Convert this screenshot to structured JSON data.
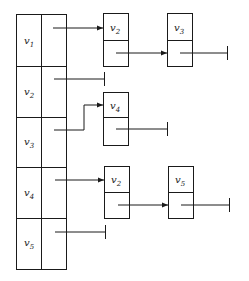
{
  "diagram": {
    "type": "adjacency-list",
    "colors": {
      "stroke": "#1a1a1a",
      "background": "#ffffff"
    },
    "head_table": {
      "rows": [
        {
          "var": "v",
          "sub": "1",
          "list": [
            {
              "var": "v",
              "sub": "2"
            },
            {
              "var": "v",
              "sub": "3"
            }
          ]
        },
        {
          "var": "v",
          "sub": "2",
          "list": []
        },
        {
          "var": "v",
          "sub": "3",
          "list": [
            {
              "var": "v",
              "sub": "4"
            }
          ]
        },
        {
          "var": "v",
          "sub": "4",
          "list": [
            {
              "var": "v",
              "sub": "2"
            },
            {
              "var": "v",
              "sub": "5"
            }
          ]
        },
        {
          "var": "v",
          "sub": "5",
          "list": []
        }
      ]
    }
  }
}
